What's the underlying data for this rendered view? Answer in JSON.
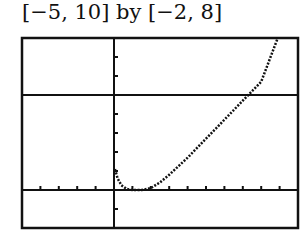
{
  "title": "[−5, 10] by [−2, 8]",
  "chart_data": {
    "type": "line",
    "title": "[−5, 10] by [−2, 8]",
    "xlim": [
      -5,
      10
    ],
    "ylim": [
      -2,
      8
    ],
    "xscale_tick": 1,
    "yscale_tick": 1,
    "horizontal_line": 5,
    "grid": false,
    "series": [
      {
        "name": "f(x)",
        "x": [
          0.05,
          0.2,
          0.4,
          0.7,
          1.0,
          1.5,
          2.0,
          2.5,
          3.0,
          4.0,
          5.0,
          6.0,
          7.0,
          8.0,
          8.9
        ],
        "y": [
          1.1,
          0.6,
          0.25,
          0.05,
          0.0,
          0.0,
          0.1,
          0.4,
          0.8,
          1.7,
          2.7,
          3.7,
          4.7,
          5.7,
          8.0
        ]
      }
    ]
  }
}
